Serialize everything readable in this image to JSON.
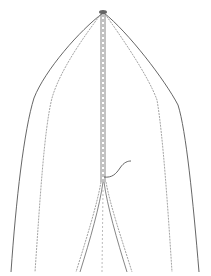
{
  "figure": {
    "type": "line-drawing",
    "background": "#ffffff",
    "stroke_dark": "#555555",
    "stroke_light": "#9a9a9a",
    "apex": [
      103,
      12
    ],
    "lines": {
      "outer_left": "M103,13 C80,30 45,70 34,98 C24,130 16,200 11,272",
      "inner_left": "M101,14 C85,35 60,70 52,98 C44,130 40,200 35,272",
      "outer_right": "M104,13 C128,32 165,80 178,105 C186,130 193,200 199,272",
      "inner_right": "M105,14 C120,35 148,75 157,100 C163,135 168,210 172,272",
      "center_dashed": "M103,14 L103,182",
      "fork_left": "M103,182 C100,205 90,240 80,272",
      "fork_left_b": "M101,182 C97,205 86,240 76,272",
      "fork_right": "M104,182 C107,205 117,240 127,272",
      "fork_right_b": "M106,182 C110,205 122,240 132,272",
      "center_lower_dashed": "M103,190 L102,272",
      "hook": "M104,177 C112,178 116,174 120,168 C124,162 128,161 131,161"
    }
  }
}
